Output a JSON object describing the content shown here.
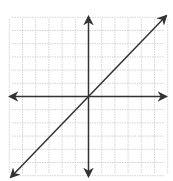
{
  "graph": {
    "description": "Coordinate plane with grid and a line through the origin with positive slope",
    "colors": {
      "background": "#ffffff",
      "grid": "#c8c8c8",
      "axis": "#333333",
      "line": "#333333"
    },
    "origin_px": [
      88.5,
      96.5
    ],
    "grid_spacing_px": 13.2,
    "grid_x_range": [
      -6,
      6
    ],
    "grid_y_range": [
      -6,
      6
    ],
    "plot_bounds_px": {
      "left": 10,
      "right": 166,
      "top": 17,
      "bottom": 176
    },
    "x_axis": {
      "from_px": 10,
      "to_px": 166,
      "arrows": "both"
    },
    "y_axis": {
      "from_px": 17,
      "to_px": 176,
      "arrows": "both"
    },
    "line": {
      "equation": "y = x",
      "slope": 1,
      "intercept": 0,
      "from_px": [
        11,
        177
      ],
      "to_px": [
        166,
        16
      ],
      "arrows": "both"
    }
  }
}
